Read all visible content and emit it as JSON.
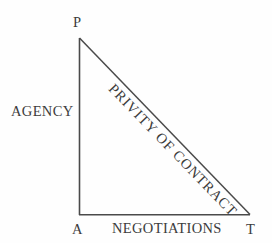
{
  "diagram": {
    "type": "right-triangle",
    "background_color": "#fefefe",
    "line_color": "#4a4a4a",
    "text_color": "#3c3c3c",
    "vertices": [
      {
        "id": "p",
        "label": "P",
        "x": 79,
        "y": 38,
        "position": "top-left-apex"
      },
      {
        "id": "a",
        "label": "A",
        "x": 79,
        "y": 215,
        "position": "bottom-left"
      },
      {
        "id": "t",
        "label": "T",
        "x": 250,
        "y": 215,
        "position": "bottom-right"
      }
    ],
    "sides": [
      {
        "id": "vertical-leg",
        "from": "p",
        "to": "a",
        "label": "AGENCY",
        "label_placement": "left-of-line"
      },
      {
        "id": "horizontal-leg",
        "from": "a",
        "to": "t",
        "label": "NEGOTIATIONS",
        "label_placement": "below-line"
      },
      {
        "id": "hypotenuse",
        "from": "p",
        "to": "t",
        "label": "PRIVITY OF CONTRACT",
        "label_placement": "along-line",
        "label_rotation_degrees": 46
      }
    ]
  }
}
